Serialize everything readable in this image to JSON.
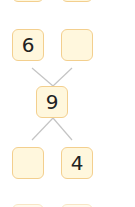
{
  "diagram": {
    "type": "number-bond",
    "colors": {
      "box_fill": "#fff7dd",
      "box_border": "#f3cf8e",
      "line": "#bdbdbd",
      "text": "#222222"
    },
    "partial_top": [
      {
        "id": "top-left-partial",
        "value": ""
      },
      {
        "id": "top-right-partial",
        "value": ""
      }
    ],
    "top_row": [
      {
        "id": "top-left",
        "value": "6"
      },
      {
        "id": "top-right",
        "value": ""
      }
    ],
    "center": {
      "id": "whole",
      "value": "9"
    },
    "bottom_row": [
      {
        "id": "bottom-left",
        "value": ""
      },
      {
        "id": "bottom-right",
        "value": "4"
      }
    ],
    "partial_bottom": [
      {
        "id": "bottom-left-partial",
        "value": ""
      },
      {
        "id": "bottom-right-partial",
        "value": ""
      }
    ]
  }
}
